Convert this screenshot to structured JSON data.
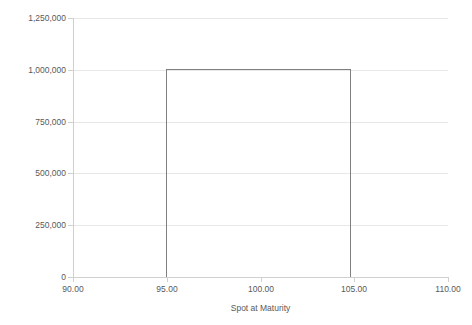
{
  "chart_data": {
    "type": "line",
    "title": "",
    "subtitle": "",
    "xlabel": "Spot at Maturity",
    "ylabel": "Payout (USD)",
    "xlim": [
      90,
      110
    ],
    "ylim": [
      0,
      1250000
    ],
    "grid": true,
    "legend": false,
    "legend_position": "none",
    "line_color": "#808080",
    "gridline_color": "#e8e8e8",
    "axis_color": "#d0d0d0",
    "text_color": "#595959",
    "x_ticks": [
      90,
      95,
      100,
      105,
      110
    ],
    "x_tick_labels": [
      "90.00",
      "95.00",
      "100.00",
      "105.00",
      "110.00"
    ],
    "y_ticks": [
      0,
      250000,
      500000,
      750000,
      1000000,
      1250000
    ],
    "y_tick_labels": [
      "0",
      "250,000",
      "500,000",
      "750,000",
      "1,000,000",
      "1,250,000"
    ],
    "series": [
      {
        "name": "Payout",
        "x": [
          90.0,
          95.0,
          95.0,
          104.8,
          104.8,
          110.0
        ],
        "values": [
          0,
          0,
          1000000,
          1000000,
          0,
          0
        ]
      }
    ]
  },
  "axes": {
    "x_title": "Spot at Maturity",
    "y_title": "Payout (USD)"
  }
}
